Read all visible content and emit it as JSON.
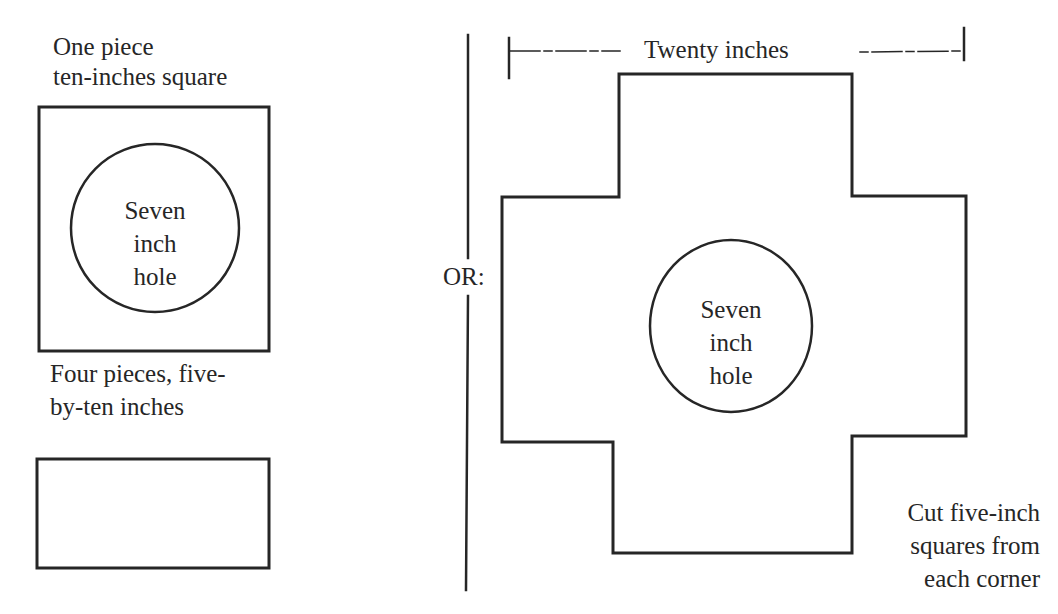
{
  "left_panel": {
    "square_caption_line1": "One piece",
    "square_caption_line2": "ten-inches square",
    "square_hole_line1": "Seven",
    "square_hole_line2": "inch",
    "square_hole_line3": "hole",
    "rect_caption_line1": "Four pieces, five-",
    "rect_caption_line2": "by-ten inches"
  },
  "divider": {
    "label": "OR:"
  },
  "right_panel": {
    "dimension_label": "Twenty inches",
    "cross_hole_line1": "Seven",
    "cross_hole_line2": "inch",
    "cross_hole_line3": "hole",
    "note_line1": "Cut five-inch",
    "note_line2": "squares from",
    "note_line3": "each corner"
  },
  "colors": {
    "ink": "#262626",
    "paper": "#ffffff"
  }
}
